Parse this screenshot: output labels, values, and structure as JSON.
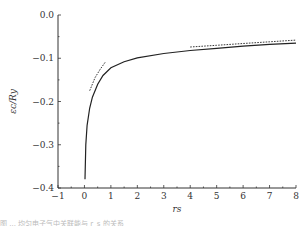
{
  "chart_data": {
    "type": "line",
    "title": "",
    "xlabel": "r_s",
    "ylabel": "ε_c/Ry",
    "xlim": [
      -1,
      8
    ],
    "ylim": [
      -0.4,
      0.0
    ],
    "grid": false,
    "legend": null,
    "x_ticks": [
      "−1",
      "0",
      "1",
      "2",
      "3",
      "4",
      "5",
      "6",
      "7",
      "8"
    ],
    "y_ticks": [
      "0.0",
      "−0.1",
      "−0.2",
      "−0.3",
      "−0.4"
    ],
    "series": [
      {
        "name": "correlation energy",
        "style": "solid",
        "x": [
          0.02,
          0.05,
          0.1,
          0.2,
          0.3,
          0.5,
          0.7,
          1.0,
          1.5,
          2.0,
          3.0,
          4.0,
          5.0,
          6.0,
          7.0,
          8.0
        ],
        "y": [
          -0.38,
          -0.3,
          -0.255,
          -0.215,
          -0.19,
          -0.16,
          -0.14,
          -0.122,
          -0.108,
          -0.099,
          -0.089,
          -0.082,
          -0.077,
          -0.072,
          -0.068,
          -0.065
        ]
      },
      {
        "name": "high-density limit",
        "style": "dashed",
        "x": [
          0.2,
          0.4,
          0.6,
          0.8
        ],
        "y": [
          -0.175,
          -0.145,
          -0.125,
          -0.108
        ]
      },
      {
        "name": "low-density limit",
        "style": "dashed",
        "x": [
          4.0,
          5.0,
          6.0,
          7.0,
          8.0
        ],
        "y": [
          -0.074,
          -0.07,
          -0.066,
          -0.062,
          -0.058
        ]
      }
    ]
  },
  "caption": "图 ... 均匀电子气中关联能与 r_s 的关系"
}
